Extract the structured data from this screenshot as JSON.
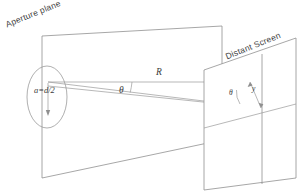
{
  "figure": {
    "type": "geometric-optics-diagram",
    "background_color": "#ffffff",
    "line_color": "#8f8f8f",
    "text_color": "#3a3a3a",
    "width": 302,
    "height": 194
  },
  "labels": {
    "aperture_plane": "Aperture plane",
    "distant_screen": "Distant Screen",
    "aperture_radius": "a=d/2",
    "distance": "R",
    "angle_aperture": "θ",
    "angle_screen": "θ",
    "screen_offset": "y"
  },
  "geometry": {
    "aperture_plane_quad": [
      [
        42,
        36
      ],
      [
        222,
        26
      ],
      [
        222,
        140
      ],
      [
        42,
        178
      ]
    ],
    "aperture_ellipse": {
      "cx": 47,
      "cy": 97,
      "rx": 20,
      "ry": 31
    },
    "aperture_center_point": [
      48,
      82
    ],
    "radius_arrow": {
      "from": [
        48,
        82
      ],
      "to": [
        48,
        114
      ]
    },
    "screen_plane_quad": [
      [
        204,
        70
      ],
      [
        296,
        38
      ],
      [
        296,
        178
      ],
      [
        204,
        190
      ]
    ],
    "screen_vertical_fold_x": 262,
    "screen_horizontal_fold": [
      [
        204,
        128
      ],
      [
        296,
        104
      ]
    ],
    "ray_axis": {
      "from": [
        48,
        82
      ],
      "to": [
        250,
        82
      ]
    },
    "ray_diffracted": {
      "from": [
        48,
        82
      ],
      "to": [
        260,
        108
      ]
    },
    "screen_vertical_offset": {
      "from": [
        250,
        82
      ],
      "to": [
        261,
        108
      ]
    },
    "arc_aperture_radius_px": 42,
    "arc_screen_radius_px": 16
  },
  "elements": {
    "aperture_plane_name": "aperture-plane",
    "distant_screen_name": "distant-screen",
    "aperture_hole_name": "circular-aperture"
  }
}
